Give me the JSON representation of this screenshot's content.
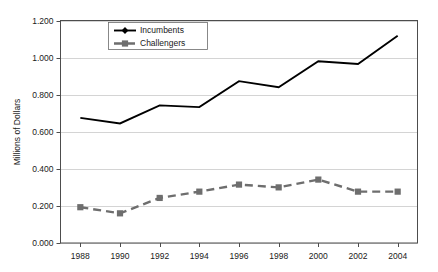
{
  "chart_data": {
    "type": "line",
    "title": "",
    "subtitle": "",
    "xlabel": "",
    "ylabel": "Millions of Dollars",
    "categories": [
      "1988",
      "1990",
      "1992",
      "1994",
      "1996",
      "1998",
      "2000",
      "2002",
      "2004"
    ],
    "x": [
      1988,
      1990,
      1992,
      1994,
      1996,
      1998,
      2000,
      2002,
      2004
    ],
    "series": [
      {
        "name": "Incumbents",
        "values": [
          0.675,
          0.645,
          0.742,
          0.733,
          0.873,
          0.84,
          0.98,
          0.965,
          1.118
        ],
        "color": "#000000",
        "marker": "diamond",
        "line_style": "solid"
      },
      {
        "name": "Challengers",
        "values": [
          0.193,
          0.16,
          0.243,
          0.277,
          0.315,
          0.3,
          0.342,
          0.277,
          0.277
        ],
        "color": "#6e6e6e",
        "marker": "square",
        "line_style": "dashed"
      }
    ],
    "ylim": [
      0.0,
      1.2
    ],
    "ytick_values": [
      0.0,
      0.2,
      0.4,
      0.6,
      0.8,
      1.0,
      1.2
    ],
    "ytick_labels": [
      "0.000",
      "0.200",
      "0.400",
      "0.600",
      "0.800",
      "1.000",
      "1.200"
    ],
    "xtick_labels": [
      "1988",
      "1990",
      "1992",
      "1994",
      "1996",
      "1998",
      "2000",
      "2002",
      "2004"
    ],
    "grid": "horizontal",
    "legend_position": "top-left-inside",
    "legend_entries": [
      "Incumbents",
      "Challengers"
    ],
    "background_color": "#ffffff",
    "gridline_color": "#c9c9c9",
    "frame_color": "#4d4d4d"
  }
}
